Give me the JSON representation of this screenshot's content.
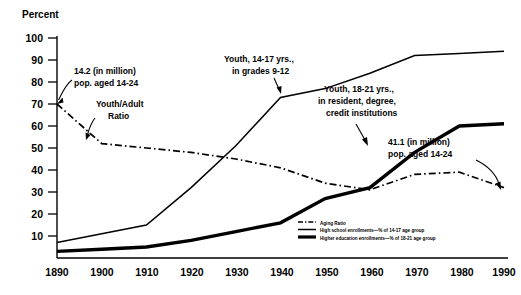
{
  "chart_data": {
    "type": "line",
    "title": "",
    "xlabel": "",
    "ylabel": "Percent",
    "x": [
      1890,
      1900,
      1910,
      1920,
      1930,
      1940,
      1950,
      1960,
      1970,
      1980,
      1990
    ],
    "categories": [
      "1890",
      "1900",
      "1910",
      "1920",
      "1930",
      "1940",
      "1950",
      "1960",
      "1970",
      "1980",
      "1990"
    ],
    "xlim": [
      1890,
      1990
    ],
    "ylim": [
      0,
      100
    ],
    "yticks": [
      10,
      20,
      30,
      40,
      50,
      60,
      70,
      80,
      90,
      100
    ],
    "ytick_labels": [
      "10",
      "20",
      "30",
      "40",
      "50",
      "60",
      "70",
      "80",
      "90",
      "100"
    ],
    "grid": false,
    "legend_position": "inside-lower-right",
    "series": [
      {
        "name": "Aging Ratio",
        "style": "dash-dot",
        "values": [
          70,
          52,
          50,
          48,
          45,
          41,
          34,
          31,
          38,
          39,
          32
        ]
      },
      {
        "name": "High school enrollments—% of 14-17 age group",
        "style": "thin-solid",
        "values": [
          7,
          11,
          15,
          32,
          51,
          73,
          77,
          84,
          92,
          93,
          94
        ]
      },
      {
        "name": "Higher education enrollments—% of 18-21 age group",
        "style": "thick-solid",
        "values": [
          3,
          4,
          5,
          8,
          12,
          16,
          27,
          32,
          48,
          60,
          61
        ]
      }
    ],
    "annotations": [
      {
        "id": "annot-pop-1890",
        "line1": "14.2 (in million)",
        "line2": "pop. aged 14-24",
        "points_to": "Aging Ratio at 1890"
      },
      {
        "id": "annot-youth-adult",
        "line1": "Youth/Adult",
        "line2": "Ratio",
        "points_to": "Aging Ratio curve"
      },
      {
        "id": "annot-high-school",
        "line1": "Youth, 14-17 yrs.,",
        "line2": "in grades 9-12",
        "points_to": "High school enrollments curve"
      },
      {
        "id": "annot-higher-ed",
        "line1": "Youth, 18-21 yrs.,",
        "line2": "in resident, degree,",
        "line3": "credit institutions",
        "points_to": "Higher education enrollments curve"
      },
      {
        "id": "annot-pop-1990",
        "line1": "41.1 (in million)",
        "line2": "pop. aged 14-24",
        "points_to": "Aging Ratio at 1990"
      }
    ],
    "legend_entries": [
      "Aging Ratio",
      "High school enrollments—% of 14-17 age group",
      "Higher education enrollments—% of 18-21 age group"
    ]
  }
}
